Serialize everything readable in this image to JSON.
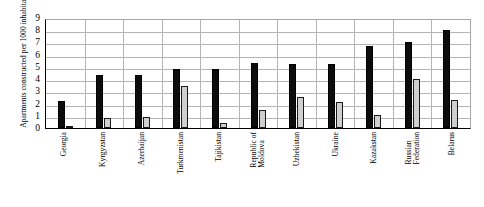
{
  "chart_data": {
    "type": "bar",
    "title": "",
    "xlabel": "",
    "ylabel": "Apartments constructed per 1000 inhabitants",
    "ylim": [
      0,
      9
    ],
    "yticks": [
      0,
      1,
      2,
      3,
      4,
      5,
      6,
      7,
      8,
      9
    ],
    "grid": true,
    "legend": "none",
    "categories": [
      "Georgia",
      "Kyrgyzstan",
      "Azerbaijan",
      "Turkmenistan",
      "Tajikistan",
      "Republic of Moldova",
      "Uzbekistan",
      "Ukraine",
      "Kazakstan",
      "Russian Federation",
      "Belarus"
    ],
    "category_lines": [
      [
        "Georgia"
      ],
      [
        "Kyrgyzstan"
      ],
      [
        "Azerbaijan"
      ],
      [
        "Turkmenistan"
      ],
      [
        "Tajikistan"
      ],
      [
        "Republic of",
        "Moldova"
      ],
      [
        "Uzbekistan"
      ],
      [
        "Ukraine"
      ],
      [
        "Kazakstan"
      ],
      [
        "Russian",
        "Federation"
      ],
      [
        "Belarus"
      ]
    ],
    "series": [
      {
        "name": "series-dark",
        "color": "#0d0d0d",
        "values": [
          2.2,
          4.3,
          4.3,
          4.8,
          4.8,
          5.3,
          5.2,
          5.2,
          6.7,
          7.0,
          8.0
        ]
      },
      {
        "name": "series-light",
        "color": "#cfcfcf",
        "values": [
          0.2,
          0.8,
          0.9,
          3.4,
          0.4,
          1.5,
          2.5,
          2.1,
          1.1,
          4.0,
          2.3
        ]
      }
    ]
  },
  "axis": {
    "y_title": "Apartments constructed per 1000 inhabitants",
    "y_tick_labels": [
      "9",
      "8",
      "7",
      "6",
      "5",
      "4",
      "3",
      "2",
      "1",
      "0"
    ]
  }
}
